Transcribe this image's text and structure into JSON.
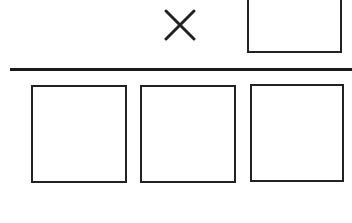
{
  "diagram": {
    "type": "vertical-multiplication-worksheet",
    "operator": "×",
    "operator_icon": "multiply-icon",
    "multiplier_box": {
      "value": ""
    },
    "product_boxes": [
      {
        "value": ""
      },
      {
        "value": ""
      },
      {
        "value": ""
      }
    ],
    "colors": {
      "stroke": "#222222",
      "background": "#ffffff"
    }
  }
}
